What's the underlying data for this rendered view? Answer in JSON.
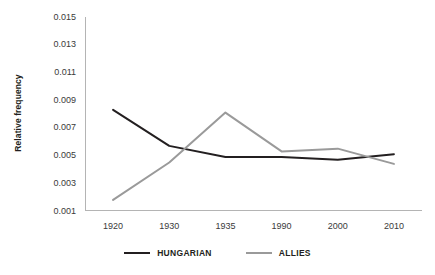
{
  "chart_data": {
    "type": "line",
    "title": "",
    "xlabel": "",
    "ylabel": "Relative frequency",
    "categories": [
      "1920",
      "1930",
      "1935",
      "1990",
      "2000",
      "2010"
    ],
    "ylim": [
      0.001,
      0.015
    ],
    "yticks": [
      0.001,
      0.003,
      0.005,
      0.007,
      0.009,
      0.011,
      0.013,
      0.015
    ],
    "ytick_labels": [
      "0.001",
      "0.003",
      "0.005",
      "0.007",
      "0.009",
      "0.011",
      "0.013",
      "0.015"
    ],
    "grid": false,
    "legend_position": "bottom",
    "series": [
      {
        "name": "HUNGARIAN",
        "color": "#231f20",
        "values": [
          0.0083,
          0.0057,
          0.0049,
          0.0049,
          0.0047,
          0.0051
        ]
      },
      {
        "name": "ALLIES",
        "color": "#9a9a9a",
        "values": [
          0.0018,
          0.0045,
          0.0081,
          0.0053,
          0.0055,
          0.0044
        ]
      }
    ]
  }
}
